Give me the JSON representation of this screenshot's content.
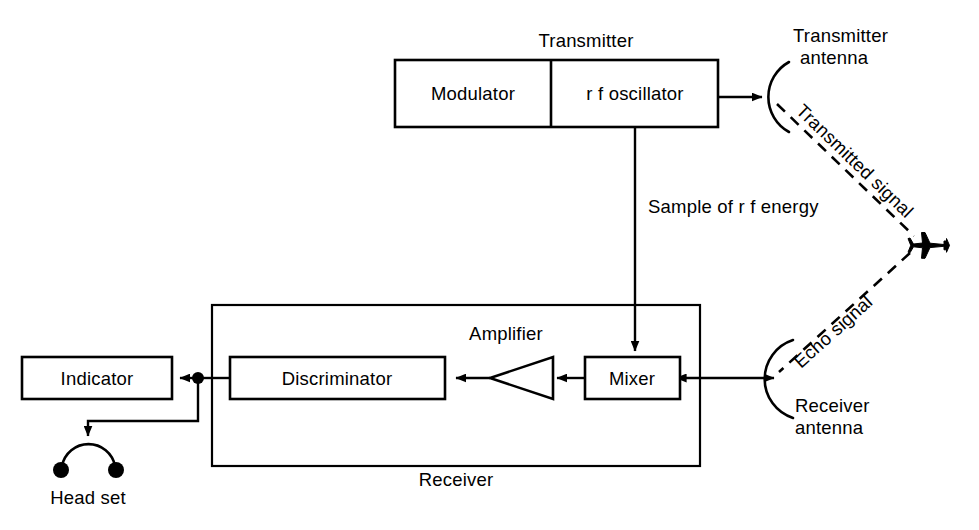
{
  "diagram": {
    "title_text": "Transmitter",
    "blocks": [
      {
        "id": "modulator",
        "label": "Modulator"
      },
      {
        "id": "rf_oscillator",
        "label": "r f oscillator"
      },
      {
        "id": "mixer",
        "label": "Mixer"
      },
      {
        "id": "discriminator",
        "label": "Discriminator"
      },
      {
        "id": "indicator",
        "label": "Indicator"
      }
    ],
    "labels": {
      "transmitter": "Transmitter",
      "transmitter_antenna_line1": "Transmitter",
      "transmitter_antenna_line2": "antenna",
      "transmitted_signal": "Transmitted signal",
      "echo_signal": "Echo signal",
      "sample_of_rf_energy": "Sample of r f energy",
      "amplifier": "Amplifier",
      "receiver": "Receiver",
      "receiver_antenna_line1": "Receiver",
      "receiver_antenna_line2": "antenna",
      "head_set": "Head set"
    },
    "colors": {
      "ink": "#000000",
      "paper": "#ffffff"
    }
  }
}
